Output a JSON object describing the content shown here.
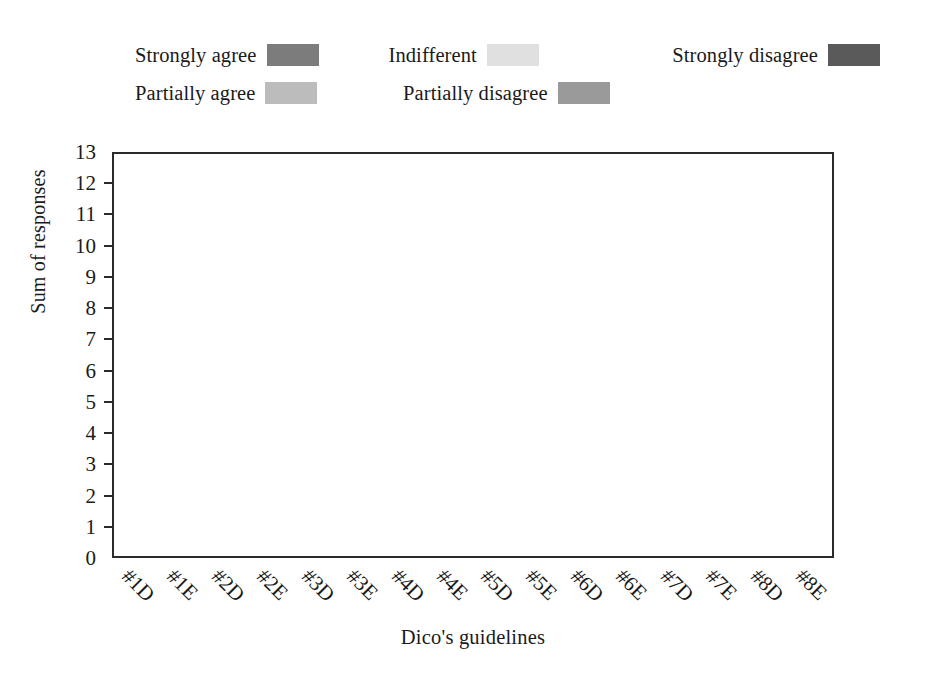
{
  "chart_data": {
    "type": "bar",
    "subtype": "stacked-bar",
    "title": "",
    "xlabel": "Dico's guidelines",
    "ylabel": "Sum of responses",
    "ylim": [
      0,
      13
    ],
    "ytick_labels": [
      "0",
      "1",
      "2",
      "3",
      "4",
      "5",
      "6",
      "7",
      "8",
      "9",
      "10",
      "11",
      "12",
      "13"
    ],
    "grid": false,
    "legend_position": "top",
    "categories": [
      "#1D",
      "#1E",
      "#2D",
      "#2E",
      "#3D",
      "#3E",
      "#4D",
      "#4E",
      "#5D",
      "#5E",
      "#6D",
      "#6E",
      "#7D",
      "#7E",
      "#8D",
      "#8E"
    ],
    "series": [
      {
        "name": "Strongly agree",
        "color": "#7c7c7c",
        "values": [
          11,
          11,
          11,
          12,
          10,
          10,
          8,
          12,
          7,
          8,
          11,
          9,
          9,
          8,
          10,
          10
        ]
      },
      {
        "name": "Partially agree",
        "color": "#bcbcbc",
        "values": [
          2,
          2,
          2,
          1,
          2,
          2,
          3,
          0,
          1,
          3.5,
          2,
          3,
          3.5,
          5,
          3,
          3
        ]
      },
      {
        "name": "Indifferent",
        "color": "#e0e0e0",
        "values": [
          0,
          0,
          0,
          0,
          0,
          1,
          0,
          0,
          3,
          0,
          0,
          0,
          0,
          0,
          0,
          0
        ]
      },
      {
        "name": "Partially disagree",
        "color": "#9a9a9a",
        "values": [
          0,
          0,
          0,
          0,
          0,
          0,
          1,
          0,
          1,
          1.5,
          0,
          1,
          0.5,
          0,
          0,
          0
        ]
      },
      {
        "name": "Strongly disagree",
        "color": "#5a5a5a",
        "values": [
          0,
          0,
          0,
          0,
          1,
          0,
          0,
          1,
          1,
          0,
          0,
          0,
          0,
          0,
          0,
          0
        ]
      }
    ],
    "stack_order_bottom_to_top": [
      "Strongly agree",
      "Partially disagree",
      "Indifferent",
      "Partially agree",
      "Strongly disagree"
    ],
    "bars": [
      {
        "category": "#1D",
        "total": 13,
        "segments": [
          {
            "series": "Strongly agree",
            "from": 0,
            "to": 11
          },
          {
            "series": "Partially agree",
            "from": 11,
            "to": 13
          }
        ]
      },
      {
        "category": "#1E",
        "total": 13,
        "segments": [
          {
            "series": "Strongly agree",
            "from": 0,
            "to": 11
          },
          {
            "series": "Partially agree",
            "from": 11,
            "to": 13
          }
        ]
      },
      {
        "category": "#2D",
        "total": 13,
        "segments": [
          {
            "series": "Strongly agree",
            "from": 0,
            "to": 11
          },
          {
            "series": "Partially agree",
            "from": 11,
            "to": 13
          }
        ]
      },
      {
        "category": "#2E",
        "total": 13,
        "segments": [
          {
            "series": "Strongly agree",
            "from": 0,
            "to": 12
          },
          {
            "series": "Partially agree",
            "from": 12,
            "to": 13
          }
        ]
      },
      {
        "category": "#3D",
        "total": 13,
        "segments": [
          {
            "series": "Strongly agree",
            "from": 0,
            "to": 10
          },
          {
            "series": "Partially agree",
            "from": 10,
            "to": 12
          },
          {
            "series": "Strongly disagree",
            "from": 12,
            "to": 13
          }
        ]
      },
      {
        "category": "#3E",
        "total": 13,
        "segments": [
          {
            "series": "Strongly agree",
            "from": 0,
            "to": 10
          },
          {
            "series": "Partially agree",
            "from": 10,
            "to": 12
          },
          {
            "series": "Indifferent",
            "from": 12,
            "to": 13
          }
        ]
      },
      {
        "category": "#4D",
        "total": 13,
        "segments": [
          {
            "series": "Strongly agree",
            "from": 0,
            "to": 8
          },
          {
            "series": "Partially agree",
            "from": 8,
            "to": 11
          },
          {
            "series": "Partially disagree",
            "from": 11,
            "to": 12
          },
          {
            "series": "Partially agree",
            "from": 12,
            "to": 13
          }
        ]
      },
      {
        "category": "#4E",
        "total": 13,
        "segments": [
          {
            "series": "Strongly agree",
            "from": 0,
            "to": 12
          },
          {
            "series": "Strongly disagree",
            "from": 12,
            "to": 13
          }
        ]
      },
      {
        "category": "#5D",
        "total": 13,
        "segments": [
          {
            "series": "Strongly agree",
            "from": 0,
            "to": 7
          },
          {
            "series": "Partially disagree",
            "from": 7,
            "to": 8
          },
          {
            "series": "Indifferent",
            "from": 8,
            "to": 11
          },
          {
            "series": "Partially agree",
            "from": 11,
            "to": 12
          },
          {
            "series": "Strongly disagree",
            "from": 12,
            "to": 13
          }
        ]
      },
      {
        "category": "#5E",
        "total": 13,
        "segments": [
          {
            "series": "Strongly agree",
            "from": 0,
            "to": 8
          },
          {
            "series": "Partially disagree",
            "from": 8,
            "to": 9
          },
          {
            "series": "Partially agree",
            "from": 9,
            "to": 12.5
          },
          {
            "series": "Partially disagree",
            "from": 12.5,
            "to": 13
          }
        ]
      },
      {
        "category": "#6D",
        "total": 13,
        "segments": [
          {
            "series": "Strongly agree",
            "from": 0,
            "to": 11
          },
          {
            "series": "Partially agree",
            "from": 11,
            "to": 13
          }
        ]
      },
      {
        "category": "#6E",
        "total": 13,
        "segments": [
          {
            "series": "Strongly agree",
            "from": 0,
            "to": 9
          },
          {
            "series": "Partially agree",
            "from": 9,
            "to": 12
          },
          {
            "series": "Partially disagree",
            "from": 12,
            "to": 13
          }
        ]
      },
      {
        "category": "#7D",
        "total": 13,
        "segments": [
          {
            "series": "Strongly agree",
            "from": 0,
            "to": 9
          },
          {
            "series": "Partially agree",
            "from": 9,
            "to": 12.5
          },
          {
            "series": "Partially disagree",
            "from": 12.5,
            "to": 13
          }
        ]
      },
      {
        "category": "#7E",
        "total": 13,
        "segments": [
          {
            "series": "Strongly agree",
            "from": 0,
            "to": 8
          },
          {
            "series": "Partially agree",
            "from": 8,
            "to": 13
          }
        ]
      },
      {
        "category": "#8D",
        "total": 13,
        "segments": [
          {
            "series": "Strongly agree",
            "from": 0,
            "to": 10
          },
          {
            "series": "Partially agree",
            "from": 10,
            "to": 13
          }
        ]
      },
      {
        "category": "#8E",
        "total": 13,
        "segments": [
          {
            "series": "Strongly agree",
            "from": 0,
            "to": 10
          },
          {
            "series": "Partially agree",
            "from": 10,
            "to": 13
          }
        ]
      }
    ]
  },
  "legend": {
    "row1": [
      {
        "label": "Strongly agree",
        "color": "#7c7c7c"
      },
      {
        "label": "Indifferent",
        "color": "#e0e0e0"
      },
      {
        "label": "Strongly disagree",
        "color": "#5a5a5a"
      }
    ],
    "row2": [
      {
        "label": "Partially agree",
        "color": "#bcbcbc"
      },
      {
        "label": "Partially disagree",
        "color": "#9a9a9a"
      }
    ]
  }
}
